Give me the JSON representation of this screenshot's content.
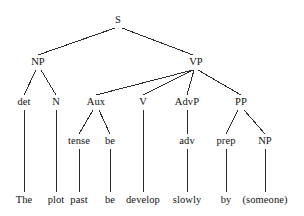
{
  "diagram": {
    "type": "syntax-tree",
    "sentence": "The plot past be develop slowly by (someone)",
    "line_color": "#2b2b2b",
    "text_color": "#111111",
    "background_color": "#ffffff",
    "width": 304,
    "height": 216,
    "nodes": [
      {
        "id": "S",
        "label": "S",
        "x": 118,
        "y": 20,
        "level": 0
      },
      {
        "id": "NP1",
        "label": "NP",
        "x": 38,
        "y": 62,
        "level": 1
      },
      {
        "id": "VP",
        "label": "VP",
        "x": 196,
        "y": 62,
        "level": 1
      },
      {
        "id": "det",
        "label": "det",
        "x": 24,
        "y": 102,
        "level": 2
      },
      {
        "id": "N",
        "label": "N",
        "x": 56,
        "y": 102,
        "level": 2
      },
      {
        "id": "Aux",
        "label": "Aux",
        "x": 96,
        "y": 102,
        "level": 2
      },
      {
        "id": "V",
        "label": "V",
        "x": 143,
        "y": 102,
        "level": 2
      },
      {
        "id": "AdvP",
        "label": "AdvP",
        "x": 187,
        "y": 102,
        "level": 2
      },
      {
        "id": "PP",
        "label": "PP",
        "x": 241,
        "y": 102,
        "level": 2
      },
      {
        "id": "tense",
        "label": "tense",
        "x": 79,
        "y": 141,
        "level": 3
      },
      {
        "id": "be",
        "label": "be",
        "x": 110,
        "y": 141,
        "level": 3
      },
      {
        "id": "adv",
        "label": "adv",
        "x": 187,
        "y": 141,
        "level": 3
      },
      {
        "id": "prep",
        "label": "prep",
        "x": 226,
        "y": 141,
        "level": 3
      },
      {
        "id": "NP2",
        "label": "NP",
        "x": 265,
        "y": 141,
        "level": 3
      }
    ],
    "leaves": [
      {
        "id": "w-the",
        "label": "The",
        "x": 24,
        "y": 200,
        "parent": "det"
      },
      {
        "id": "w-plot",
        "label": "plot",
        "x": 56,
        "y": 200,
        "parent": "N"
      },
      {
        "id": "w-past",
        "label": "past",
        "x": 79,
        "y": 200,
        "parent": "tense"
      },
      {
        "id": "w-be",
        "label": "be",
        "x": 110,
        "y": 200,
        "parent": "be"
      },
      {
        "id": "w-develop",
        "label": "develop",
        "x": 143,
        "y": 200,
        "parent": "V"
      },
      {
        "id": "w-slowly",
        "label": "slowly",
        "x": 187,
        "y": 200,
        "parent": "adv"
      },
      {
        "id": "w-by",
        "label": "by",
        "x": 226,
        "y": 200,
        "parent": "prep"
      },
      {
        "id": "w-someone",
        "label": "(someone)",
        "x": 265,
        "y": 200,
        "parent": "NP2"
      }
    ],
    "edges": [
      {
        "from": "S",
        "to": "NP1",
        "x1": 115,
        "y1": 28,
        "x2": 38,
        "y2": 55
      },
      {
        "from": "S",
        "to": "VP",
        "x1": 122,
        "y1": 28,
        "x2": 193,
        "y2": 55
      },
      {
        "from": "NP1",
        "to": "det",
        "x1": 36,
        "y1": 70,
        "x2": 24,
        "y2": 95
      },
      {
        "from": "NP1",
        "to": "N",
        "x1": 41,
        "y1": 70,
        "x2": 56,
        "y2": 95
      },
      {
        "from": "VP",
        "to": "Aux",
        "x1": 193,
        "y1": 70,
        "x2": 96,
        "y2": 95
      },
      {
        "from": "VP",
        "to": "V",
        "x1": 193,
        "y1": 70,
        "x2": 143,
        "y2": 95
      },
      {
        "from": "VP",
        "to": "AdvP",
        "x1": 194,
        "y1": 70,
        "x2": 187,
        "y2": 95
      },
      {
        "from": "VP",
        "to": "PP",
        "x1": 198,
        "y1": 70,
        "x2": 241,
        "y2": 95
      },
      {
        "from": "Aux",
        "to": "tense",
        "x1": 93,
        "y1": 110,
        "x2": 79,
        "y2": 134
      },
      {
        "from": "Aux",
        "to": "be",
        "x1": 99,
        "y1": 110,
        "x2": 110,
        "y2": 134
      },
      {
        "from": "AdvP",
        "to": "adv",
        "x1": 187,
        "y1": 110,
        "x2": 187,
        "y2": 134
      },
      {
        "from": "PP",
        "to": "prep",
        "x1": 238,
        "y1": 110,
        "x2": 226,
        "y2": 134
      },
      {
        "from": "PP",
        "to": "NP2",
        "x1": 244,
        "y1": 110,
        "x2": 265,
        "y2": 134
      },
      {
        "from": "det",
        "to": "w-the",
        "x1": 24,
        "y1": 110,
        "x2": 24,
        "y2": 192
      },
      {
        "from": "N",
        "to": "w-plot",
        "x1": 56,
        "y1": 110,
        "x2": 56,
        "y2": 192
      },
      {
        "from": "tense",
        "to": "w-past",
        "x1": 79,
        "y1": 149,
        "x2": 79,
        "y2": 192
      },
      {
        "from": "be",
        "to": "w-be",
        "x1": 110,
        "y1": 149,
        "x2": 110,
        "y2": 192
      },
      {
        "from": "V",
        "to": "w-develop",
        "x1": 143,
        "y1": 110,
        "x2": 143,
        "y2": 192
      },
      {
        "from": "adv",
        "to": "w-slowly",
        "x1": 187,
        "y1": 149,
        "x2": 187,
        "y2": 192
      },
      {
        "from": "prep",
        "to": "w-by",
        "x1": 226,
        "y1": 149,
        "x2": 226,
        "y2": 192
      },
      {
        "from": "NP2",
        "to": "w-someone",
        "x1": 265,
        "y1": 149,
        "x2": 265,
        "y2": 192
      }
    ]
  }
}
